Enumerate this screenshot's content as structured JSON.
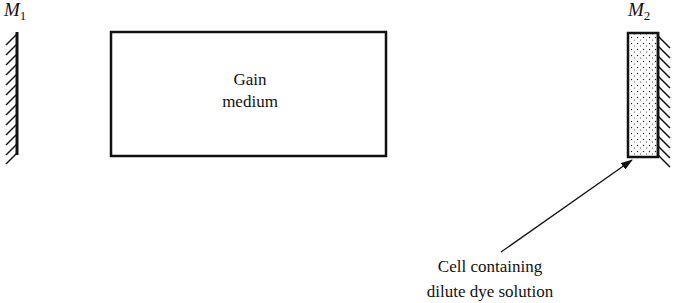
{
  "diagram": {
    "type": "laser cavity schematic",
    "mirror_left": {
      "label": "M",
      "subscript": "1"
    },
    "mirror_right": {
      "label": "M",
      "subscript": "2"
    },
    "gain_medium": {
      "line1": "Gain",
      "line2": "medium"
    },
    "dye_cell": {
      "caption_line1": "Cell containing",
      "caption_line2": "dilute dye solution"
    },
    "colors": {
      "ink": "#111111",
      "background": "#ffffff"
    }
  }
}
